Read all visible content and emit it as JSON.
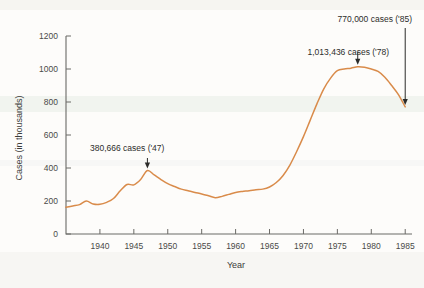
{
  "chart_data": {
    "type": "line",
    "title": "",
    "xlabel": "Year",
    "ylabel": "Cases (in thousands)",
    "xlim": [
      1935,
      1986
    ],
    "ylim": [
      0,
      1200
    ],
    "grid": false,
    "legend": "none",
    "line_color": "#d98b4a",
    "x_ticks": [
      1940,
      1945,
      1950,
      1955,
      1960,
      1965,
      1970,
      1975,
      1980,
      1985
    ],
    "x_tick_labels": [
      "1940",
      "1945",
      "1950",
      "1955",
      "1960",
      "1965",
      "1970",
      "1975",
      "1980",
      "1985"
    ],
    "y_ticks": [
      0,
      200,
      400,
      600,
      800,
      1000,
      1200
    ],
    "y_tick_labels": [
      "0",
      "200",
      "400",
      "600",
      "800",
      "1000",
      "1200"
    ],
    "series": [
      {
        "name": "Cases",
        "x": [
          1935,
          1936,
          1937,
          1938,
          1939,
          1940,
          1941,
          1942,
          1943,
          1944,
          1945,
          1946,
          1947,
          1948,
          1949,
          1950,
          1951,
          1952,
          1953,
          1954,
          1955,
          1956,
          1957,
          1958,
          1959,
          1960,
          1961,
          1962,
          1963,
          1964,
          1965,
          1966,
          1967,
          1968,
          1969,
          1970,
          1971,
          1972,
          1973,
          1974,
          1975,
          1976,
          1977,
          1978,
          1979,
          1980,
          1981,
          1982,
          1983,
          1984,
          1985
        ],
        "values": [
          162,
          170,
          178,
          200,
          182,
          180,
          192,
          215,
          262,
          300,
          298,
          330,
          385,
          358,
          330,
          305,
          288,
          272,
          262,
          252,
          243,
          232,
          220,
          228,
          240,
          252,
          258,
          262,
          268,
          272,
          285,
          312,
          355,
          418,
          500,
          590,
          690,
          790,
          880,
          945,
          990,
          1000,
          1005,
          1013,
          1010,
          1000,
          985,
          950,
          900,
          845,
          770
        ]
      }
    ],
    "annotations": [
      {
        "label": "380,666 cases ('47)",
        "x": 1947,
        "value": 385
      },
      {
        "label": "1,013,436 cases ('78)",
        "x": 1978,
        "value": 1013
      },
      {
        "label": "770,000 cases ('85)",
        "x": 1985,
        "value": 770
      }
    ]
  }
}
